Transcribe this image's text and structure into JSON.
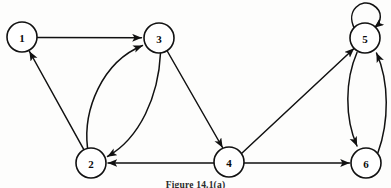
{
  "figure": {
    "caption": "Figure 14.1(a)",
    "background_color": "#fdfdfc",
    "ink_color": "#111111",
    "node_fill": "#ffffff"
  },
  "graph": {
    "type": "directed-graph",
    "node_radius": 15,
    "nodes": [
      {
        "id": "1",
        "label": "1",
        "x": 22,
        "y": 37
      },
      {
        "id": "2",
        "label": "2",
        "x": 91,
        "y": 163
      },
      {
        "id": "3",
        "label": "3",
        "x": 159,
        "y": 38
      },
      {
        "id": "4",
        "label": "4",
        "x": 229,
        "y": 162
      },
      {
        "id": "5",
        "label": "5",
        "x": 365,
        "y": 38
      },
      {
        "id": "6",
        "label": "6",
        "x": 366,
        "y": 163
      }
    ],
    "edges": [
      {
        "from": "1",
        "to": "3",
        "shape": "straight",
        "name": "edge-1-3"
      },
      {
        "from": "2",
        "to": "1",
        "shape": "straight",
        "name": "edge-2-1"
      },
      {
        "from": "2",
        "to": "3",
        "shape": "curved-left",
        "name": "edge-2-3"
      },
      {
        "from": "3",
        "to": "2",
        "shape": "curved-right",
        "name": "edge-3-2"
      },
      {
        "from": "3",
        "to": "4",
        "shape": "straight",
        "name": "edge-3-4"
      },
      {
        "from": "4",
        "to": "2",
        "shape": "straight",
        "name": "edge-4-2"
      },
      {
        "from": "4",
        "to": "5",
        "shape": "straight",
        "name": "edge-4-5"
      },
      {
        "from": "4",
        "to": "6",
        "shape": "straight",
        "name": "edge-4-6"
      },
      {
        "from": "5",
        "to": "5",
        "shape": "self-loop",
        "name": "edge-5-5-self-loop"
      },
      {
        "from": "5",
        "to": "6",
        "shape": "curved-left",
        "name": "edge-5-6"
      },
      {
        "from": "6",
        "to": "5",
        "shape": "curved-right",
        "name": "edge-6-5"
      }
    ]
  }
}
